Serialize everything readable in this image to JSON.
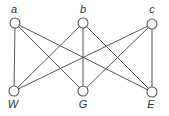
{
  "diagram": {
    "type": "complete-bipartite-graph",
    "colors": {
      "stroke": "#555555",
      "node_fill": "#ffffff",
      "label": "#333333"
    },
    "nodes": [
      {
        "id": "a",
        "label": "a",
        "x": 15,
        "y": 23,
        "lx": 14,
        "ly": 13
      },
      {
        "id": "b",
        "label": "b",
        "x": 83,
        "y": 23,
        "lx": 83,
        "ly": 13
      },
      {
        "id": "c",
        "label": "c",
        "x": 152,
        "y": 24,
        "lx": 152,
        "ly": 13
      },
      {
        "id": "W",
        "label": "W",
        "x": 14,
        "y": 91,
        "lx": 13,
        "ly": 108
      },
      {
        "id": "G",
        "label": "G",
        "x": 83,
        "y": 91,
        "lx": 83,
        "ly": 108
      },
      {
        "id": "E",
        "label": "E",
        "x": 152,
        "y": 92,
        "lx": 151,
        "ly": 108
      }
    ],
    "edges": [
      [
        "a",
        "W"
      ],
      [
        "a",
        "G"
      ],
      [
        "a",
        "E"
      ],
      [
        "b",
        "W"
      ],
      [
        "b",
        "G"
      ],
      [
        "b",
        "E"
      ],
      [
        "c",
        "W"
      ],
      [
        "c",
        "G"
      ],
      [
        "c",
        "E"
      ]
    ]
  }
}
